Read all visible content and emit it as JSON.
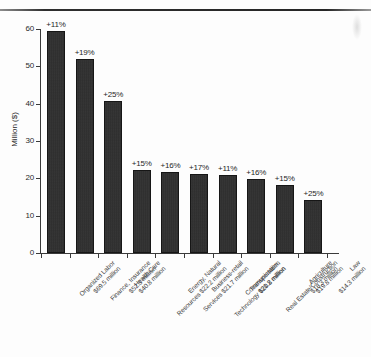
{
  "figure": {
    "ylabel": "Million ($)",
    "y_ticks": [
      "0",
      "10",
      "20",
      "30",
      "40",
      "50",
      "60"
    ]
  },
  "chart_data": {
    "type": "bar",
    "title": "",
    "xlabel": "",
    "ylabel": "Million ($)",
    "ylim": [
      0,
      60
    ],
    "y_ticks": [
      0,
      10,
      20,
      30,
      40,
      50,
      60
    ],
    "grid": false,
    "legend": "none",
    "bar_color": "#282828",
    "categories": [
      "Organized Labor",
      "Finance, Insurance",
      "Health Care",
      "Energy, Natural Resources",
      "Business-retail Services",
      "Communication, Technology",
      "Transportation",
      "Real Estate/Construction",
      "Agriculture",
      "Law"
    ],
    "category_labels": [
      {
        "line1": "Organized Labor",
        "line2": "$69.5 million"
      },
      {
        "line1": "Finance, Insurance",
        "line2": "$52.3 million"
      },
      {
        "line1": "Health Care",
        "line2": "$40.8 million"
      },
      {
        "line1": "Energy, Natural",
        "line2": "Resources $22.2 million"
      },
      {
        "line1": "Business-retail",
        "line2": "Services $21.7 million"
      },
      {
        "line1": "Communication,",
        "line2": "Technology $21.2 million"
      },
      {
        "line1": "Transportation",
        "line2": "$20.8 million"
      },
      {
        "line1": "Real Estate/Construction",
        "line2": "$19.8 million"
      },
      {
        "line1": "Agriculture",
        "line2": "$18.3 million"
      },
      {
        "line1": "Law",
        "line2": "$14.3 million"
      }
    ],
    "values": [
      59.5,
      52.0,
      40.8,
      22.2,
      21.7,
      21.2,
      20.8,
      19.8,
      18.3,
      14.3
    ],
    "amount_labels": [
      "$69.5 million",
      "$52.3 million",
      "$40.8 million",
      "$22.2 million",
      "$21.7 million",
      "$21.2 million",
      "$20.8 million",
      "$19.8 million",
      "$18.3 million",
      "$14.3 million"
    ],
    "data_labels": [
      "+11%",
      "+19%",
      "+25%",
      "+15%",
      "+16%",
      "+17%",
      "+11%",
      "+16%",
      "+15%",
      "+25%"
    ],
    "series": [
      {
        "name": "Contributions",
        "values": [
          59.5,
          52.0,
          40.8,
          22.2,
          21.7,
          21.2,
          20.8,
          19.8,
          18.3,
          14.3
        ]
      }
    ]
  }
}
